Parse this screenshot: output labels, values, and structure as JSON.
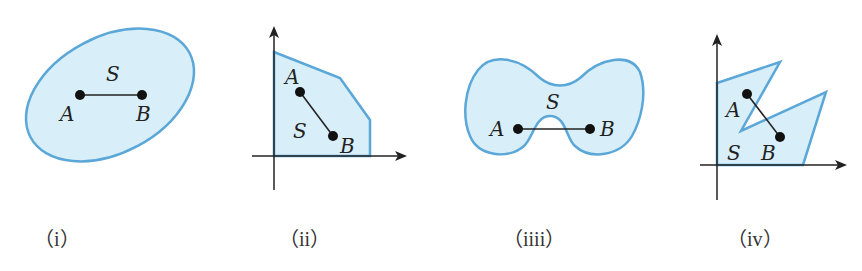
{
  "figures": [
    {
      "id": "i",
      "caption": "（i）",
      "shape": "ellipse",
      "labels": {
        "set": "S",
        "point_a": "A",
        "point_b": "B"
      },
      "convex": true
    },
    {
      "id": "ii",
      "caption": "（ii）",
      "shape": "polygon-with-axes",
      "labels": {
        "set": "S",
        "point_a": "A",
        "point_b": "B"
      },
      "convex": true
    },
    {
      "id": "iii",
      "caption": "（iiii）",
      "shape": "bowtie-blob",
      "labels": {
        "set": "S",
        "point_a": "A",
        "point_b": "B"
      },
      "convex": false
    },
    {
      "id": "iv",
      "caption": "（iv）",
      "shape": "notched-polygon-with-axes",
      "labels": {
        "set": "S",
        "point_a": "A",
        "point_b": "B"
      },
      "convex": false
    }
  ],
  "colors": {
    "region_fill": "#d8eef8",
    "region_stroke": "#5aa7d8",
    "ink": "#222222"
  }
}
